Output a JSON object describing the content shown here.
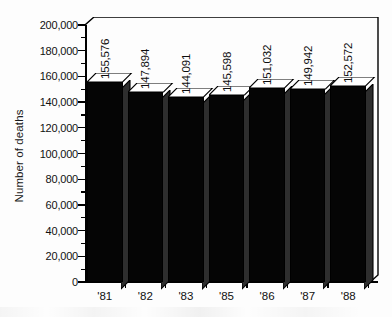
{
  "chart_data": {
    "type": "bar",
    "title": "",
    "subtitle": "",
    "xlabel": "",
    "ylabel": "Number of deaths",
    "categories": [
      "'81",
      "'82",
      "'83",
      "'85",
      "'86",
      "'87",
      "'88"
    ],
    "values": [
      155576,
      147894,
      144091,
      145598,
      151032,
      149942,
      152572
    ],
    "value_labels": [
      "155,576",
      "147,894",
      "144,091",
      "145,598",
      "151,032",
      "149,942",
      "152,572"
    ],
    "ylim": [
      0,
      200000
    ],
    "ytick_step": 20000,
    "ytick_labels": [
      "200,000",
      "180,000",
      "160,000",
      "140,000",
      "120,000",
      "100,000",
      "80,000",
      "60,000",
      "40,000",
      "20,000",
      "0"
    ],
    "ytick_values": [
      200000,
      180000,
      160000,
      140000,
      120000,
      100000,
      80000,
      60000,
      40000,
      20000,
      0
    ],
    "minor_ticks": true,
    "grid": false,
    "legend": null,
    "legend_position": "none",
    "style": "3d-column",
    "colors": {
      "bar_front": "#050505",
      "bar_top": "#ffffff",
      "bar_side": "#3a3a3a",
      "axis": "#000000",
      "text": "#111111",
      "background": "#fdfdfd"
    }
  }
}
